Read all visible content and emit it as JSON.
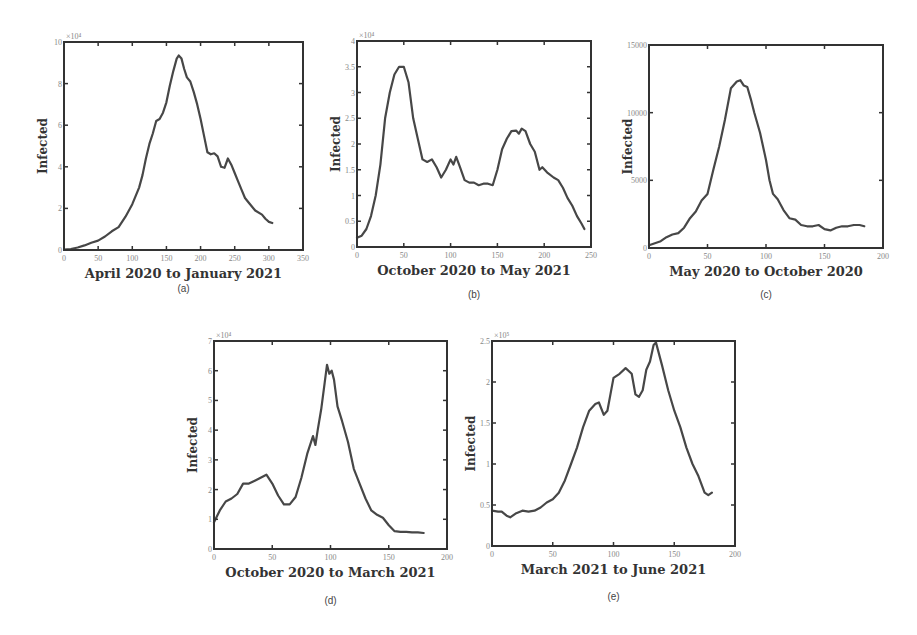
{
  "figure": {
    "line_color": "#474747"
  },
  "chart_data": [
    {
      "id": "a",
      "type": "line",
      "panel_label": "(a)",
      "title": "",
      "xlabel": "April 2020 to January 2021",
      "ylabel": "Infected",
      "xlim": [
        0,
        350
      ],
      "ylim": [
        0,
        100000
      ],
      "y_exponent_label": "×10⁴",
      "xticks": [
        0,
        50,
        100,
        150,
        200,
        250,
        300,
        350
      ],
      "xtick_labels": [
        "0",
        "50",
        "100",
        "150",
        "200",
        "250",
        "300",
        "350"
      ],
      "yticks": [
        0,
        20000,
        40000,
        60000,
        80000,
        100000
      ],
      "ytick_labels": [
        "0",
        "2",
        "4",
        "6",
        "8",
        "10"
      ],
      "grid": false,
      "series": [
        {
          "name": "Infected",
          "x": [
            0,
            10,
            20,
            30,
            40,
            50,
            60,
            70,
            80,
            90,
            100,
            110,
            115,
            120,
            125,
            130,
            135,
            140,
            145,
            150,
            155,
            160,
            165,
            168,
            172,
            176,
            180,
            185,
            190,
            195,
            200,
            205,
            210,
            215,
            220,
            225,
            230,
            235,
            240,
            245,
            250,
            255,
            260,
            265,
            270,
            280,
            290,
            295,
            300,
            305
          ],
          "y": [
            200,
            500,
            1200,
            2200,
            3500,
            4500,
            6500,
            9000,
            11000,
            16000,
            22000,
            30000,
            36000,
            44000,
            51000,
            56000,
            62000,
            63000,
            66000,
            71000,
            79000,
            86000,
            92000,
            93500,
            92000,
            87000,
            83000,
            81000,
            76000,
            70000,
            63000,
            55000,
            47000,
            46000,
            46500,
            45000,
            40000,
            39500,
            44000,
            41000,
            37000,
            33000,
            29000,
            25000,
            23000,
            19000,
            17000,
            15000,
            13500,
            13000
          ]
        }
      ]
    },
    {
      "id": "b",
      "type": "line",
      "panel_label": "(b)",
      "title": "",
      "xlabel": "October 2020 to May 2021",
      "ylabel": "Infected",
      "xlim": [
        0,
        250
      ],
      "ylim": [
        0,
        40000
      ],
      "y_exponent_label": "×10⁴",
      "xticks": [
        0,
        50,
        100,
        150,
        200,
        250
      ],
      "xtick_labels": [
        "0",
        "50",
        "100",
        "150",
        "200",
        "250"
      ],
      "yticks": [
        0,
        5000,
        10000,
        15000,
        20000,
        25000,
        30000,
        35000,
        40000
      ],
      "ytick_labels": [
        "0",
        "0.5",
        "1",
        "1.5",
        "2",
        "2.5",
        "3",
        "3.5",
        "4"
      ],
      "grid": false,
      "series": [
        {
          "name": "Infected",
          "x": [
            0,
            5,
            10,
            15,
            20,
            25,
            30,
            35,
            40,
            45,
            50,
            55,
            60,
            65,
            70,
            75,
            80,
            85,
            90,
            95,
            100,
            103,
            106,
            110,
            115,
            120,
            125,
            130,
            135,
            140,
            145,
            150,
            155,
            160,
            165,
            170,
            173,
            176,
            180,
            185,
            190,
            195,
            198,
            203,
            210,
            215,
            220,
            225,
            230,
            235,
            240,
            243
          ],
          "y": [
            1800,
            2200,
            3500,
            6000,
            10000,
            16000,
            25000,
            30000,
            33500,
            35000,
            35000,
            32000,
            25000,
            21000,
            17000,
            16500,
            17000,
            15500,
            13500,
            15000,
            17000,
            16000,
            17500,
            15500,
            13000,
            12500,
            12500,
            12000,
            12300,
            12300,
            12000,
            15000,
            19000,
            21000,
            22500,
            22600,
            22000,
            23000,
            22500,
            20000,
            18500,
            15000,
            15500,
            14500,
            13500,
            13000,
            11500,
            9500,
            8000,
            6000,
            4500,
            3500
          ]
        }
      ]
    },
    {
      "id": "c",
      "type": "line",
      "panel_label": "(c)",
      "title": "",
      "xlabel": "May 2020 to October 2020",
      "ylabel": "Infected",
      "xlim": [
        0,
        200
      ],
      "ylim": [
        0,
        15000
      ],
      "y_exponent_label": "",
      "xticks": [
        0,
        50,
        100,
        150,
        200
      ],
      "xtick_labels": [
        "0",
        "50",
        "100",
        "150",
        "200"
      ],
      "yticks": [
        0,
        5000,
        10000,
        15000
      ],
      "ytick_labels": [
        "0",
        "5000",
        "10000",
        "15000"
      ],
      "grid": false,
      "series": [
        {
          "name": "Infected",
          "x": [
            0,
            5,
            10,
            15,
            20,
            25,
            30,
            35,
            40,
            45,
            50,
            55,
            60,
            65,
            70,
            75,
            78,
            81,
            84,
            87,
            90,
            95,
            100,
            103,
            106,
            110,
            115,
            120,
            125,
            130,
            135,
            140,
            145,
            150,
            155,
            160,
            165,
            170,
            175,
            180,
            184
          ],
          "y": [
            200,
            350,
            500,
            800,
            1000,
            1100,
            1500,
            2200,
            2700,
            3500,
            4000,
            5800,
            7500,
            9500,
            11800,
            12300,
            12400,
            12000,
            11900,
            11000,
            10000,
            8500,
            6500,
            5000,
            4000,
            3600,
            2800,
            2200,
            2100,
            1700,
            1600,
            1600,
            1700,
            1400,
            1300,
            1500,
            1600,
            1600,
            1700,
            1700,
            1600
          ]
        }
      ]
    },
    {
      "id": "d",
      "type": "line",
      "panel_label": "(d)",
      "title": "",
      "xlabel": "October 2020 to March 2021",
      "ylabel": "Infected",
      "xlim": [
        0,
        200
      ],
      "ylim": [
        0,
        70000
      ],
      "y_exponent_label": "×10⁴",
      "xticks": [
        0,
        50,
        100,
        150,
        200
      ],
      "xtick_labels": [
        "0",
        "50",
        "100",
        "150",
        "200"
      ],
      "yticks": [
        0,
        10000,
        20000,
        30000,
        40000,
        50000,
        60000,
        70000
      ],
      "ytick_labels": [
        "0",
        "1",
        "2",
        "3",
        "4",
        "5",
        "6",
        "7"
      ],
      "grid": false,
      "series": [
        {
          "name": "Infected",
          "x": [
            0,
            5,
            10,
            15,
            20,
            25,
            30,
            35,
            40,
            45,
            50,
            55,
            60,
            65,
            70,
            75,
            80,
            85,
            87,
            89,
            92,
            95,
            97,
            99,
            101,
            103,
            106,
            110,
            115,
            120,
            125,
            130,
            135,
            140,
            145,
            150,
            155,
            160,
            165,
            170,
            175,
            180
          ],
          "y": [
            9000,
            13000,
            16000,
            17000,
            18500,
            22000,
            22000,
            23000,
            24000,
            25000,
            22000,
            18000,
            15000,
            15000,
            17500,
            24000,
            32000,
            38000,
            35000,
            40000,
            47000,
            56000,
            62000,
            59000,
            60000,
            57000,
            48000,
            43000,
            36000,
            27000,
            22000,
            17000,
            13000,
            11500,
            10500,
            8000,
            6000,
            5800,
            5800,
            5600,
            5600,
            5400
          ]
        }
      ]
    },
    {
      "id": "e",
      "type": "line",
      "panel_label": "(e)",
      "title": "",
      "xlabel": "March 2021 to June 2021",
      "ylabel": "Infected",
      "xlim": [
        0,
        200
      ],
      "ylim": [
        0,
        250000
      ],
      "y_exponent_label": "×10⁵",
      "xticks": [
        0,
        50,
        100,
        150,
        200
      ],
      "xtick_labels": [
        "0",
        "50",
        "100",
        "150",
        "200"
      ],
      "yticks": [
        0,
        50000,
        100000,
        150000,
        200000,
        250000
      ],
      "ytick_labels": [
        "0",
        "0.5",
        "1",
        "1.5",
        "2",
        "2.5"
      ],
      "grid": false,
      "series": [
        {
          "name": "Infected",
          "x": [
            0,
            5,
            8,
            12,
            15,
            20,
            25,
            30,
            35,
            40,
            45,
            50,
            55,
            60,
            65,
            70,
            75,
            80,
            85,
            88,
            92,
            95,
            100,
            105,
            110,
            115,
            118,
            121,
            124,
            127,
            130,
            133,
            135,
            140,
            145,
            150,
            155,
            160,
            165,
            170,
            175,
            178,
            181
          ],
          "y": [
            43000,
            42000,
            42000,
            37000,
            35000,
            40000,
            43000,
            42000,
            43000,
            47000,
            53000,
            57000,
            65000,
            80000,
            100000,
            120000,
            145000,
            165000,
            173000,
            175000,
            160000,
            165000,
            205000,
            210000,
            217000,
            210000,
            185000,
            182000,
            190000,
            215000,
            225000,
            245000,
            248000,
            220000,
            190000,
            165000,
            145000,
            120000,
            100000,
            85000,
            65000,
            62000,
            65000
          ]
        }
      ]
    }
  ]
}
